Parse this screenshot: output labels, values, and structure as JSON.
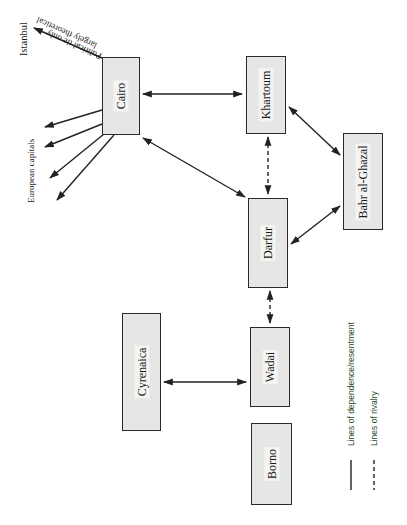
{
  "diagram": {
    "orientation": "rotated 90 degrees counter-clockwise (text reads bottom-to-top)",
    "nodes": [
      {
        "id": "cairo",
        "label": "Cairo"
      },
      {
        "id": "khartoum",
        "label": "Khartoum"
      },
      {
        "id": "bahr",
        "label": "Bahr al-Ghazal"
      },
      {
        "id": "darfur",
        "label": "Darfur"
      },
      {
        "id": "wadai",
        "label": "Wadai"
      },
      {
        "id": "cyrenaica",
        "label": "Cyrenaica"
      },
      {
        "id": "borno",
        "label": "Borno"
      }
    ],
    "external": {
      "istanbul": "Istanbul",
      "istanbul_note_line1": "Political tie only",
      "istanbul_note_line2": "largely theoretical",
      "european_capitals": "European capitals"
    },
    "edges": [
      {
        "from": "cairo",
        "to": "khartoum",
        "style": "solid",
        "arrows": "both"
      },
      {
        "from": "cairo",
        "to": "darfur",
        "style": "solid",
        "arrows": "both"
      },
      {
        "from": "khartoum",
        "to": "darfur",
        "style": "dashed",
        "arrows": "both"
      },
      {
        "from": "khartoum",
        "to": "bahr",
        "style": "solid",
        "arrows": "both"
      },
      {
        "from": "darfur",
        "to": "bahr",
        "style": "solid",
        "arrows": "both"
      },
      {
        "from": "darfur",
        "to": "wadai",
        "style": "dashed",
        "arrows": "both"
      },
      {
        "from": "cyrenaica",
        "to": "wadai",
        "style": "solid",
        "arrows": "both"
      },
      {
        "from": "cairo",
        "to": "istanbul",
        "style": "solid",
        "arrows": "end"
      },
      {
        "from": "cairo",
        "to": "european_capitals",
        "style": "solid",
        "arrows": "end",
        "count": 4
      }
    ],
    "legend": {
      "solid": "Lines of dependence/resentment",
      "dashed": "Lines of rivalry"
    },
    "colors": {
      "box_fill": "#e6e6e4",
      "box_border": "#2a2a2a",
      "line": "#222222",
      "legend_text": "#2d4a2d"
    }
  }
}
